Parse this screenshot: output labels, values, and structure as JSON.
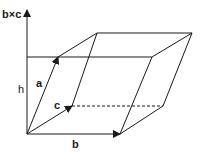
{
  "diagram": {
    "labels": {
      "axis": "b×c",
      "height": "h",
      "a": "a",
      "b": "b",
      "c": "c"
    },
    "colors": {
      "line": "#1a1a1a",
      "background": "#ffffff"
    },
    "vectors": [
      {
        "name": "a",
        "from": [
          27,
          134
        ],
        "to": [
          58,
          57
        ]
      },
      {
        "name": "b",
        "from": [
          27,
          134
        ],
        "to": [
          120,
          134
        ]
      },
      {
        "name": "c",
        "from": [
          27,
          134
        ],
        "to": [
          72,
          106
        ]
      }
    ]
  }
}
